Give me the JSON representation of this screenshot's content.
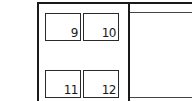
{
  "diagram": {
    "type": "panel-layout",
    "slots": [
      {
        "id": "9",
        "label": "9"
      },
      {
        "id": "10",
        "label": "10"
      },
      {
        "id": "11",
        "label": "11"
      },
      {
        "id": "12",
        "label": "12"
      }
    ],
    "colors": {
      "line": "#1a1a1a",
      "background": "#ffffff"
    }
  }
}
